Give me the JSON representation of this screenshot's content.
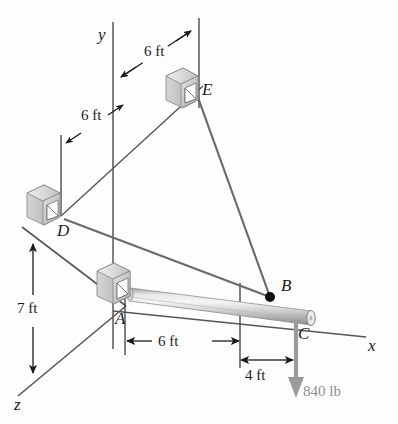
{
  "figure": {
    "type": "engineering-statics-free-body-diagram",
    "background_color": "#fefefe",
    "line_color": "#565656",
    "text_color": "#1a1a1a",
    "load_color": "#8d8d8d",
    "bracket_color": "#c9c9c9",
    "beam_color": "#bdbdbd"
  },
  "axes": [
    {
      "id": "y",
      "label": "y"
    },
    {
      "id": "x",
      "label": "x"
    },
    {
      "id": "z",
      "label": "z"
    }
  ],
  "points": [
    {
      "id": "A",
      "label": "A",
      "desc": "ball-and-socket support at wall, left end of beam"
    },
    {
      "id": "B",
      "label": "B",
      "desc": "cable attachment node on beam"
    },
    {
      "id": "C",
      "label": "C",
      "desc": "free right end of beam where load is applied"
    },
    {
      "id": "D",
      "label": "D",
      "desc": "cable anchor bracket on left wall"
    },
    {
      "id": "E",
      "label": "E",
      "desc": "cable anchor bracket on upper wall"
    }
  ],
  "dimensions": [
    {
      "id": "dim-top-6ft",
      "label": "6 ft",
      "desc": "horizontal offset from y-axis line to E vertical line"
    },
    {
      "id": "dim-left-6ft",
      "label": "6 ft",
      "desc": "offset along z from D vertical line to y-axis line"
    },
    {
      "id": "dim-7ft",
      "label": "7 ft",
      "desc": "vertical height from z-axis to D level"
    },
    {
      "id": "dim-ab-6ft",
      "label": "6 ft",
      "desc": "distance from A to B along the beam"
    },
    {
      "id": "dim-bc-4ft",
      "label": "4 ft",
      "desc": "distance from B to C along the beam"
    }
  ],
  "load": {
    "id": "load-840lb",
    "label": "840 lb",
    "magnitude": 840,
    "unit": "lb",
    "direction": "downward (negative y)",
    "applied_at": "C"
  },
  "members": [
    {
      "id": "beam-AC",
      "from": "A",
      "to": "C",
      "type": "rod"
    },
    {
      "id": "cable-BD",
      "from": "B",
      "to": "D",
      "type": "cable"
    },
    {
      "id": "cable-BE",
      "from": "B",
      "to": "E",
      "type": "cable"
    }
  ]
}
